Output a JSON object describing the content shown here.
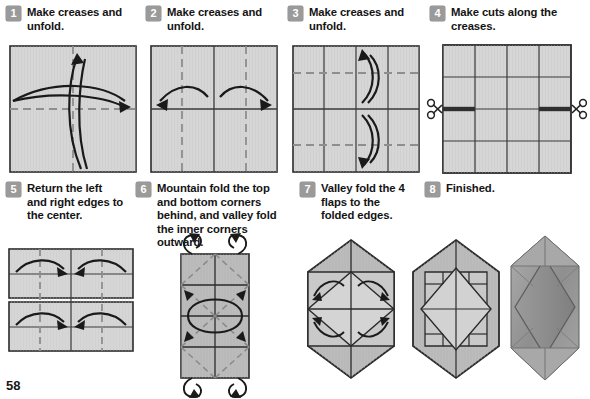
{
  "page": {
    "number": "58",
    "paper_color": "#d6d6d6",
    "paper_shade_color": "#b9b9b9",
    "paper_dark_color": "#9d9d9d",
    "line_color": "#2b2b2b",
    "crease_color": "#8e8e8e",
    "badge_color": "#9a9a9a",
    "cut_color": "#3a3a3a",
    "photo_color": "#9a9a9a"
  },
  "steps": [
    {
      "number": "1",
      "caption": "Make creases and unfold.",
      "figure": "square-diagonal-creases"
    },
    {
      "number": "2",
      "caption": "Make creases and unfold.",
      "figure": "square-quarter-verticals"
    },
    {
      "number": "3",
      "caption": "Make creases and unfold.",
      "figure": "square-quarter-horizontals"
    },
    {
      "number": "4",
      "caption": "Make cuts along the creases.",
      "figure": "square-grid-with-cuts"
    },
    {
      "number": "5",
      "caption": "Return the left and right edges to the center.",
      "figure": "cut-sheet-fold-in"
    },
    {
      "number": "6",
      "caption": "Mountain fold the top and bottom corners behind, and valley fold the inner corners outward.",
      "figure": "tall-rectangle-mountain-folds"
    },
    {
      "number": "7",
      "caption": "Valley fold the 4 flaps to the folded edges.",
      "figure": "hexagon-flaps"
    },
    {
      "number": "8",
      "caption": "Finished.",
      "figure": "finished-result"
    }
  ],
  "icons": {
    "scissors_left": "scissors-icon",
    "scissors_right": "scissors-icon"
  }
}
